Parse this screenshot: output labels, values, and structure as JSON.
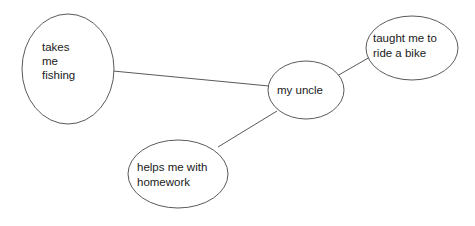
{
  "diagram": {
    "type": "concept-map",
    "title": "my uncle",
    "background_color": "#ffffff",
    "stroke_color": "#5a5a5a",
    "text_color": "#1a1a1a",
    "center_node": {
      "id": "my-uncle",
      "label": "my uncle",
      "lines": [
        "my uncle"
      ],
      "cx": 306,
      "cy": 90,
      "rx": 38,
      "ry": 29,
      "text_x": 277,
      "text_y": 94,
      "text_anchor": "start"
    },
    "nodes": [
      {
        "id": "takes-me-fishing",
        "label": "takes me fishing",
        "lines": [
          "takes",
          "me",
          "fishing"
        ],
        "cx": 68,
        "cy": 69,
        "rx": 46,
        "ry": 55,
        "text_x": 42,
        "text_y": 51,
        "line_height": 14,
        "text_anchor": "start"
      },
      {
        "id": "taught-me-to-ride-a-bike",
        "label": "taught me to ride a bike",
        "lines": [
          "taught me to",
          "ride a bike"
        ],
        "cx": 412,
        "cy": 48,
        "rx": 46,
        "ry": 32,
        "text_x": 373,
        "text_y": 42,
        "line_height": 15,
        "text_anchor": "start"
      },
      {
        "id": "helps-me-with-homework",
        "label": "helps me with homework",
        "lines": [
          "helps me with",
          "homework"
        ],
        "cx": 178,
        "cy": 174,
        "rx": 50,
        "ry": 34,
        "text_x": 137,
        "text_y": 171,
        "line_height": 15,
        "text_anchor": "start"
      }
    ],
    "edges": [
      {
        "id": "edge-uncle-fishing",
        "from": "my-uncle",
        "to": "takes-me-fishing",
        "x1": 269,
        "y1": 86,
        "x2": 113,
        "y2": 71
      },
      {
        "id": "edge-uncle-bike",
        "from": "my-uncle",
        "to": "taught-me-to-ride-a-bike",
        "x1": 337,
        "y1": 76,
        "x2": 370,
        "y2": 57
      },
      {
        "id": "edge-uncle-homework",
        "from": "my-uncle",
        "to": "helps-me-with-homework",
        "x1": 277,
        "y1": 111,
        "x2": 218,
        "y2": 147
      }
    ]
  }
}
